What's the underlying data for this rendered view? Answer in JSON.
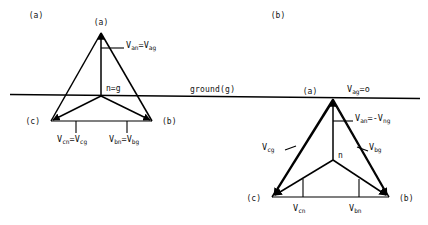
{
  "figure": {
    "background": "#ffffff",
    "stroke": "#000000",
    "width": 428,
    "height": 225,
    "ground": {
      "label": "ground(g)",
      "name": "ground-line"
    },
    "captions": [
      {
        "id": "caption-a",
        "text": "(a)",
        "x": 36,
        "y": 18
      },
      {
        "id": "caption-b",
        "text": "(b)",
        "x": 278,
        "y": 18
      }
    ],
    "panels": [
      {
        "id": "panel-a",
        "caption": "(a)",
        "vertices": [
          {
            "id": "vertex-a",
            "label": "(a)",
            "x": 101,
            "y": 31
          },
          {
            "id": "vertex-b",
            "label": "(b)",
            "x": 152,
            "y": 121
          },
          {
            "id": "vertex-c",
            "label": "(c)",
            "x": 51,
            "y": 121
          }
        ],
        "neutral": {
          "id": "neutral-node",
          "label": "n=g",
          "x": 101,
          "y": 96
        },
        "voltages": [
          {
            "id": "v-an-ag",
            "base": "V",
            "sub1": "an",
            "eq": "=V",
            "sub2": "ag",
            "x": 127,
            "y": 49
          },
          {
            "id": "v-cn-cg",
            "base": "V",
            "sub1": "cn",
            "eq": "=V",
            "sub2": "cg",
            "x": 66,
            "y": 141
          },
          {
            "id": "v-bn-bg",
            "base": "V",
            "sub1": "bn",
            "eq": "=V",
            "sub2": "bg",
            "x": 118,
            "y": 141
          }
        ]
      },
      {
        "id": "panel-b",
        "caption": "(b)",
        "vertices": [
          {
            "id": "vertex-a",
            "label": "(a)",
            "x": 310,
            "y": 97
          },
          {
            "id": "vertex-b",
            "label": "(b)",
            "x": 392,
            "y": 200
          },
          {
            "id": "vertex-c",
            "label": "(c)",
            "x": 264,
            "y": 200
          }
        ],
        "neutral": {
          "id": "neutral-node",
          "label": "n",
          "x": 338,
          "y": 160
        },
        "voltages": [
          {
            "id": "v-ag-zero",
            "base": "V",
            "sub1": "ag",
            "eq": "=o",
            "sub2": "",
            "x": 347,
            "y": 92
          },
          {
            "id": "v-an-ng",
            "base": "V",
            "sub1": "an",
            "eq": "=-V",
            "sub2": "ng",
            "x": 356,
            "y": 122
          },
          {
            "id": "v-cg",
            "base": "V",
            "sub1": "cg",
            "eq": "",
            "sub2": "",
            "x": 265,
            "y": 150
          },
          {
            "id": "v-bg",
            "base": "V",
            "sub1": "bg",
            "eq": "",
            "sub2": "",
            "x": 364,
            "y": 150
          },
          {
            "id": "v-cn",
            "base": "V",
            "sub1": "cn",
            "eq": "",
            "sub2": "",
            "x": 293,
            "y": 210
          },
          {
            "id": "v-bn",
            "base": "V",
            "sub1": "bn",
            "eq": "",
            "sub2": "",
            "x": 350,
            "y": 210
          }
        ]
      }
    ]
  }
}
